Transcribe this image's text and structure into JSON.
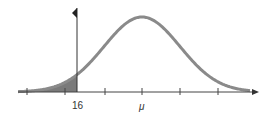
{
  "chart_data": {
    "type": "area",
    "title": "",
    "xlabel": "",
    "ylabel": "",
    "tick_labels": [
      "16",
      "μ"
    ],
    "shaded_region": {
      "from": "-inf",
      "to": "16"
    },
    "mean_label": "μ",
    "cutoff_value": 16,
    "grid": false,
    "legend": null,
    "colors": {
      "curve": "#8a8a8a",
      "shade": "#7a7a7a",
      "axis": "#444444"
    }
  },
  "labels": {
    "cutoff": "16",
    "mean": "μ"
  }
}
